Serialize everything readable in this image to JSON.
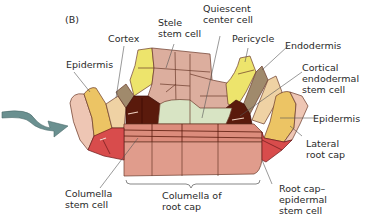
{
  "panel_label": "(B)",
  "labels": {
    "cortex": "Cortex",
    "stele": "Stele\nstem cell",
    "quiescent": "Quiescent\ncenter cell",
    "pericycle": "Pericycle",
    "endodermis": "Endodermis",
    "cortical": "Cortical\nendodermal\nstem cell",
    "epidermis_left": "Epidermis",
    "epidermis_right": "Epidermis",
    "lateral_root_cap": "Lateral\nroot cap",
    "columella_stem": "Columella\nstem cell",
    "columella_root_cap": "Columella of\nroot cap",
    "root_cap_epidermal": "Root cap–\nepidermal\nstem cell"
  },
  "colors": {
    "stele": "#dcae9e",
    "quiescent": "#d8e4c4",
    "pericycle": "#ede46c",
    "endodermis": "#a08a6c",
    "cortex": "#efd2a4",
    "epidermis": "#ecc464",
    "lateral_root_cap": "#eec6b4",
    "initials": "#5a1a0c",
    "columella": "#dc8c7c",
    "root_cap_epidermal": "#d84c4c",
    "arrow": "#6a9090"
  }
}
